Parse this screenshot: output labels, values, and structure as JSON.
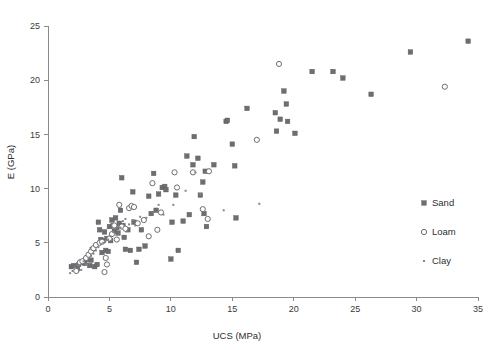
{
  "chart_data": {
    "type": "scatter",
    "title": "",
    "xlabel": "UCS (MPa)",
    "ylabel": "E (GPa)",
    "xlim": [
      0,
      35
    ],
    "ylim": [
      0,
      25
    ],
    "xticks": [
      0,
      5,
      10,
      15,
      20,
      25,
      30,
      35
    ],
    "yticks": [
      0,
      5,
      10,
      15,
      20,
      25
    ],
    "xtick_labels": [
      "0",
      "5",
      "10",
      "15",
      "20",
      "25",
      "30",
      "35"
    ],
    "ytick_labels": [
      "0",
      "5",
      "10",
      "15",
      "20",
      "25"
    ],
    "grid": false,
    "legend_position": "right",
    "marker_color": "#6e6e72",
    "axis_color": "#8a8a8a",
    "series": [
      {
        "name": "Sand",
        "marker": "filled-square",
        "points": [
          [
            1.9,
            2.8
          ],
          [
            2.1,
            2.9
          ],
          [
            2.4,
            2.6
          ],
          [
            2.5,
            3.0
          ],
          [
            2.7,
            3.2
          ],
          [
            3.0,
            3.1
          ],
          [
            3.2,
            3.5
          ],
          [
            3.4,
            2.9
          ],
          [
            3.5,
            3.4
          ],
          [
            3.6,
            4.4
          ],
          [
            3.8,
            2.8
          ],
          [
            4.0,
            3.0
          ],
          [
            4.1,
            6.9
          ],
          [
            4.2,
            6.2
          ],
          [
            4.3,
            5.3
          ],
          [
            4.4,
            4.1
          ],
          [
            4.5,
            5.2
          ],
          [
            4.6,
            6.0
          ],
          [
            4.7,
            4.3
          ],
          [
            4.8,
            5.4
          ],
          [
            4.9,
            4.2
          ],
          [
            5.0,
            6.5
          ],
          [
            5.1,
            5.2
          ],
          [
            5.2,
            7.1
          ],
          [
            5.3,
            6.6
          ],
          [
            5.4,
            6.1
          ],
          [
            5.5,
            7.3
          ],
          [
            5.6,
            6.4
          ],
          [
            5.7,
            5.9
          ],
          [
            5.8,
            6.8
          ],
          [
            5.9,
            8.0
          ],
          [
            6.0,
            11.0
          ],
          [
            6.1,
            6.6
          ],
          [
            6.2,
            5.5
          ],
          [
            6.3,
            4.4
          ],
          [
            6.5,
            6.2
          ],
          [
            6.7,
            4.3
          ],
          [
            6.9,
            9.7
          ],
          [
            7.0,
            6.9
          ],
          [
            7.2,
            3.2
          ],
          [
            7.4,
            4.4
          ],
          [
            7.6,
            6.2
          ],
          [
            7.9,
            4.7
          ],
          [
            8.2,
            9.3
          ],
          [
            8.4,
            7.7
          ],
          [
            8.6,
            11.4
          ],
          [
            8.8,
            8.0
          ],
          [
            9.0,
            9.5
          ],
          [
            9.3,
            10.1
          ],
          [
            9.5,
            10.2
          ],
          [
            9.6,
            9.9
          ],
          [
            10.0,
            3.5
          ],
          [
            10.1,
            6.9
          ],
          [
            10.4,
            9.4
          ],
          [
            10.6,
            4.3
          ],
          [
            11.0,
            7.0
          ],
          [
            11.3,
            13.0
          ],
          [
            11.5,
            7.6
          ],
          [
            11.8,
            12.2
          ],
          [
            11.9,
            14.8
          ],
          [
            12.2,
            12.8
          ],
          [
            12.4,
            9.4
          ],
          [
            12.6,
            10.6
          ],
          [
            12.7,
            7.7
          ],
          [
            12.8,
            11.6
          ],
          [
            12.9,
            6.5
          ],
          [
            13.5,
            12.2
          ],
          [
            14.5,
            16.2
          ],
          [
            14.6,
            16.3
          ],
          [
            15.0,
            14.1
          ],
          [
            15.2,
            12.1
          ],
          [
            15.3,
            7.3
          ],
          [
            16.2,
            17.4
          ],
          [
            18.5,
            17.0
          ],
          [
            18.6,
            15.3
          ],
          [
            18.9,
            16.4
          ],
          [
            19.2,
            19.0
          ],
          [
            19.4,
            17.8
          ],
          [
            19.5,
            16.2
          ],
          [
            20.1,
            15.1
          ],
          [
            21.5,
            20.8
          ],
          [
            23.2,
            20.8
          ],
          [
            24.0,
            20.2
          ],
          [
            26.3,
            18.7
          ],
          [
            29.5,
            22.6
          ],
          [
            34.2,
            23.6
          ]
        ]
      },
      {
        "name": "Loam",
        "marker": "open-circle",
        "points": [
          [
            2.3,
            2.4
          ],
          [
            2.6,
            3.2
          ],
          [
            2.8,
            3.3
          ],
          [
            3.1,
            3.6
          ],
          [
            3.3,
            3.9
          ],
          [
            3.5,
            4.2
          ],
          [
            3.7,
            4.5
          ],
          [
            3.9,
            4.8
          ],
          [
            4.2,
            5.0
          ],
          [
            4.4,
            5.1
          ],
          [
            4.6,
            2.3
          ],
          [
            4.7,
            3.6
          ],
          [
            4.8,
            3.0
          ],
          [
            5.0,
            5.4
          ],
          [
            5.2,
            5.8
          ],
          [
            5.4,
            6.6
          ],
          [
            5.6,
            5.3
          ],
          [
            5.8,
            8.5
          ],
          [
            6.0,
            6.5
          ],
          [
            6.3,
            6.3
          ],
          [
            6.6,
            8.2
          ],
          [
            6.8,
            8.4
          ],
          [
            7.0,
            8.3
          ],
          [
            7.3,
            6.8
          ],
          [
            7.8,
            7.1
          ],
          [
            8.2,
            5.6
          ],
          [
            8.5,
            10.5
          ],
          [
            8.9,
            6.2
          ],
          [
            9.2,
            7.8
          ],
          [
            10.3,
            11.5
          ],
          [
            10.5,
            10.1
          ],
          [
            11.8,
            11.5
          ],
          [
            12.6,
            8.1
          ],
          [
            13.0,
            7.2
          ],
          [
            13.1,
            11.6
          ],
          [
            17.0,
            14.5
          ],
          [
            18.8,
            21.5
          ],
          [
            32.3,
            19.4
          ]
        ]
      },
      {
        "name": "Clay",
        "marker": "small-dot",
        "points": [
          [
            1.8,
            2.2
          ],
          [
            2.0,
            2.4
          ],
          [
            2.2,
            2.7
          ],
          [
            2.5,
            2.9
          ],
          [
            2.7,
            2.5
          ],
          [
            2.9,
            3.3
          ],
          [
            3.1,
            3.0
          ],
          [
            3.3,
            3.6
          ],
          [
            3.5,
            3.8
          ],
          [
            3.7,
            4.0
          ],
          [
            3.9,
            4.3
          ],
          [
            4.1,
            4.6
          ],
          [
            4.3,
            4.9
          ],
          [
            4.5,
            5.0
          ],
          [
            4.7,
            5.2
          ],
          [
            4.9,
            5.3
          ],
          [
            5.1,
            5.6
          ],
          [
            5.3,
            6.0
          ],
          [
            5.5,
            6.3
          ],
          [
            5.7,
            6.5
          ],
          [
            5.9,
            6.4
          ],
          [
            6.1,
            7.0
          ],
          [
            6.3,
            7.2
          ],
          [
            6.6,
            6.7
          ],
          [
            6.9,
            7.1
          ],
          [
            7.1,
            6.6
          ],
          [
            7.5,
            7.4
          ],
          [
            8.0,
            7.3
          ],
          [
            9.0,
            8.5
          ],
          [
            9.4,
            7.6
          ],
          [
            10.2,
            8.5
          ],
          [
            11.2,
            9.8
          ],
          [
            12.0,
            11.5
          ],
          [
            12.4,
            9.5
          ],
          [
            14.3,
            8.0
          ],
          [
            17.2,
            8.6
          ]
        ]
      }
    ]
  },
  "legend": {
    "items": [
      {
        "label": "Sand",
        "marker": "filled-square"
      },
      {
        "label": "Loam",
        "marker": "open-circle"
      },
      {
        "label": "Clay",
        "marker": "small-dot"
      }
    ]
  }
}
